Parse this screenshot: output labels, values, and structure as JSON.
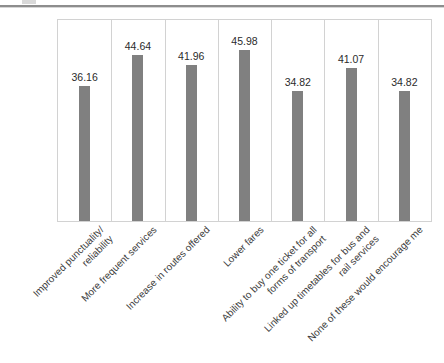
{
  "decor": {
    "top_remnant": "partial-glyph",
    "divider": "horizontal-rule"
  },
  "chart_data": {
    "type": "bar",
    "title": "",
    "subtitle": "",
    "xlabel": "",
    "ylabel": "",
    "ylim": [
      0,
      54
    ],
    "grid": "vertical-category-separators",
    "legend": "none",
    "orientation": "vertical",
    "bar_color": "#808080",
    "frame_color": "#d2d2d2",
    "categories": [
      "Improved punctuality/\nreliability",
      "More frequent services",
      "Increase in routes offered",
      "Lower fares",
      "Ability to buy one ticket for all\nforms of transport",
      "Linked up timetables for bus and\nrail services",
      "None of these would encourage me"
    ],
    "values": [
      36.16,
      44.64,
      41.96,
      45.98,
      34.82,
      41.07,
      34.82
    ],
    "value_labels": [
      "36.16",
      "44.64",
      "41.96",
      "45.98",
      "34.82",
      "41.07",
      "34.82"
    ]
  }
}
